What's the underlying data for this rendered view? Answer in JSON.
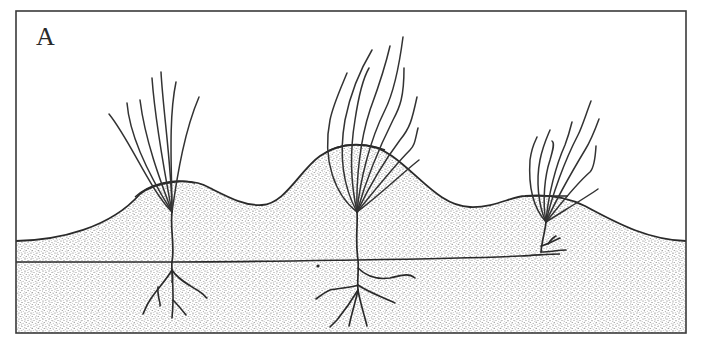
{
  "figure": {
    "panel_label": "A",
    "colors": {
      "ink": "#2a2a2a",
      "paper": "#ffffff",
      "sand_stipple": "#8a8a8a"
    },
    "elements": {
      "hummocks": [
        {
          "name": "left-hummock",
          "crest_x": 170,
          "crest_y": 181
        },
        {
          "name": "middle-hummock",
          "crest_x": 355,
          "crest_y": 143
        },
        {
          "name": "right-hummock",
          "crest_x": 545,
          "crest_y": 196
        }
      ],
      "valleys": [
        {
          "x": 255,
          "y": 205
        },
        {
          "x": 470,
          "y": 207
        }
      ],
      "plants": [
        {
          "name": "left-tuft",
          "base_x": 172,
          "base_y": 212,
          "blades": 7
        },
        {
          "name": "middle-tuft",
          "base_x": 357,
          "base_y": 212,
          "blades": 9
        },
        {
          "name": "right-tuft",
          "base_x": 546,
          "base_y": 222,
          "blades": 8
        }
      ],
      "rhizome": {
        "start_x": 16,
        "end_x": 560,
        "y_approx": 260
      }
    }
  }
}
